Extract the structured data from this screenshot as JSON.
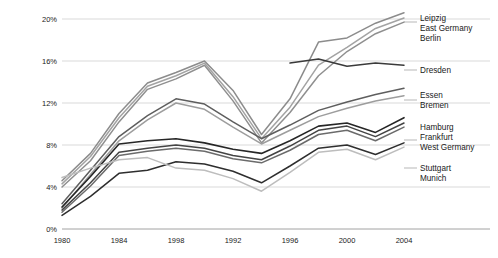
{
  "chart_data": {
    "type": "line",
    "title": "",
    "subtitle": "",
    "xlabel": "",
    "ylabel": "",
    "xlim": [
      1980,
      2004
    ],
    "ylim": [
      0,
      20
    ],
    "grid": true,
    "legend_position": "right-inline",
    "x": [
      1980,
      1982,
      1984,
      1986,
      1988,
      1990,
      1992,
      1994,
      1996,
      1998,
      2000,
      2002,
      2004
    ],
    "ytick_labels": [
      "0%",
      "4%",
      "8%",
      "12%",
      "16%",
      "20%"
    ],
    "ytick_values": [
      0,
      4,
      8,
      12,
      16,
      20
    ],
    "xtick_labels": [
      "1980",
      "1984",
      "1998",
      "1992",
      "1996",
      "2000",
      "2004"
    ],
    "xtick_values": [
      1980,
      1984,
      1988,
      1992,
      1996,
      2000,
      2004
    ],
    "series": [
      {
        "name": "Leipzig",
        "color": "#8c8c8c",
        "width": 1.5,
        "values": [
          4.6,
          7.2,
          11.0,
          13.9,
          14.9,
          16.0,
          13.2,
          9.0,
          12.4,
          17.8,
          18.2,
          19.6,
          20.6
        ]
      },
      {
        "name": "East Germany",
        "color": "#a3a3a3",
        "width": 1.5,
        "values": [
          4.3,
          6.9,
          10.6,
          13.6,
          14.6,
          15.8,
          12.6,
          8.6,
          11.6,
          15.6,
          17.3,
          19.1,
          20.1
        ]
      },
      {
        "name": "Berlin",
        "color": "#8f8f8f",
        "width": 1.5,
        "values": [
          4.0,
          6.5,
          10.2,
          13.3,
          14.3,
          15.6,
          12.2,
          8.2,
          11.1,
          14.6,
          16.9,
          18.6,
          19.7
        ]
      },
      {
        "name": "Dresden",
        "color": "#3a3a3a",
        "width": 1.5,
        "values": [
          null,
          null,
          null,
          null,
          null,
          null,
          null,
          null,
          15.8,
          16.2,
          15.5,
          15.8,
          15.6
        ]
      },
      {
        "name": "Essen",
        "color": "#5e5e5e",
        "width": 1.5,
        "values": [
          2.4,
          5.6,
          8.8,
          10.8,
          12.4,
          11.9,
          10.2,
          8.6,
          9.9,
          11.3,
          12.1,
          12.8,
          13.4
        ]
      },
      {
        "name": "Bremen",
        "color": "#9d9d9d",
        "width": 1.5,
        "values": [
          2.0,
          5.2,
          8.4,
          10.4,
          12.0,
          11.4,
          9.7,
          8.1,
          9.4,
          10.7,
          11.5,
          12.2,
          12.7
        ]
      },
      {
        "name": "Hamburg",
        "color": "#262626",
        "width": 1.6,
        "values": [
          2.1,
          5.0,
          8.1,
          8.4,
          8.6,
          8.2,
          7.6,
          7.2,
          8.4,
          9.8,
          10.1,
          9.2,
          10.6
        ]
      },
      {
        "name": "Frankfurt",
        "color": "#444444",
        "width": 1.5,
        "values": [
          1.8,
          4.4,
          7.3,
          7.7,
          8.0,
          7.7,
          7.0,
          6.6,
          7.9,
          9.4,
          9.8,
          8.8,
          10.1
        ]
      },
      {
        "name": "West Germany",
        "color": "#6b6b6b",
        "width": 1.5,
        "values": [
          1.6,
          4.1,
          7.0,
          7.4,
          7.7,
          7.4,
          6.7,
          6.3,
          7.5,
          9.0,
          9.4,
          8.4,
          9.7
        ]
      },
      {
        "name": "Stuttgart",
        "color": "#2e2e2e",
        "width": 1.5,
        "values": [
          1.3,
          3.1,
          5.3,
          5.6,
          6.4,
          6.2,
          5.5,
          4.4,
          6.0,
          7.7,
          8.0,
          7.1,
          8.2
        ]
      },
      {
        "name": "Munich",
        "color": "#bdbdbd",
        "width": 1.5,
        "values": [
          4.9,
          5.8,
          6.6,
          6.8,
          5.8,
          5.6,
          4.8,
          3.6,
          5.4,
          7.3,
          7.6,
          6.6,
          7.8
        ]
      }
    ],
    "legend_groups": [
      {
        "labels": [
          "Leipzig",
          "East Germany",
          "Berlin"
        ]
      },
      {
        "labels": [
          "Dresden"
        ]
      },
      {
        "labels": [
          "Essen",
          "Bremen"
        ]
      },
      {
        "labels": [
          "Hamburg",
          "Frankfurt",
          "West Germany"
        ]
      },
      {
        "labels": [
          "Stuttgart",
          "Munich"
        ]
      }
    ],
    "legend_entries": [
      {
        "label": "Leipzig",
        "y": 18
      },
      {
        "label": "East Germany",
        "y": 28
      },
      {
        "label": "Berlin",
        "y": 38
      },
      {
        "label": "Dresden",
        "y": 70
      },
      {
        "label": "Essen",
        "y": 95
      },
      {
        "label": "Bremen",
        "y": 105
      },
      {
        "label": "Hamburg",
        "y": 127
      },
      {
        "label": "Frankfurt",
        "y": 137
      },
      {
        "label": "West Germany",
        "y": 147
      },
      {
        "label": "Stuttgart",
        "y": 168
      },
      {
        "label": "Munich",
        "y": 178
      }
    ]
  },
  "colors": {
    "background": "#ffffff",
    "gridline": "#c9c9c9",
    "axis": "#8a8a8a",
    "text": "#1a1a1a"
  }
}
